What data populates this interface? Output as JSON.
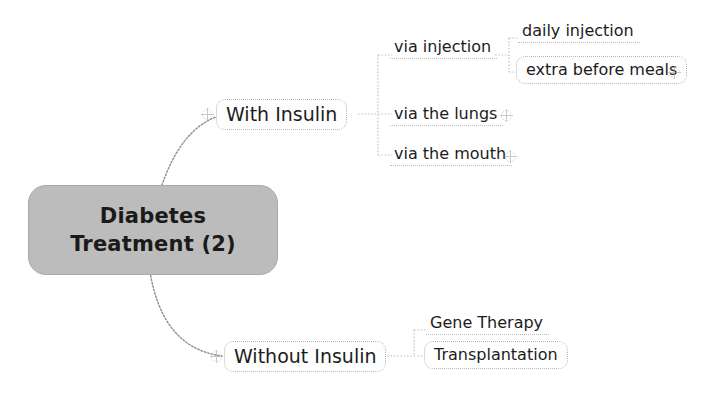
{
  "diagram": {
    "type": "mind-map",
    "background_color": "#ffffff",
    "root": {
      "label_line1": "Diabetes",
      "label_line2": "Treatment (2)",
      "fill_color": "#bcbcbc",
      "text_color": "#1a1a1a"
    },
    "branches": [
      {
        "id": "with-insulin",
        "label": "With Insulin",
        "children": [
          {
            "id": "via-injection",
            "label": "via injection",
            "children": [
              {
                "id": "daily-injection",
                "label": "daily injection"
              },
              {
                "id": "extra-before-meals",
                "label": "extra before meals"
              }
            ]
          },
          {
            "id": "via-the-lungs",
            "label": "via the lungs"
          },
          {
            "id": "via-the-mouth",
            "label": "via the mouth"
          }
        ]
      },
      {
        "id": "without-insulin",
        "label": "Without Insulin",
        "children": [
          {
            "id": "gene-therapy",
            "label": "Gene Therapy"
          },
          {
            "id": "transplantation",
            "label": "Transplantation"
          }
        ]
      }
    ],
    "expanders": [
      {
        "id": "expander-with-insulin"
      },
      {
        "id": "expander-extra-before-meals"
      },
      {
        "id": "expander-via-the-lungs"
      },
      {
        "id": "expander-via-the-mouth"
      },
      {
        "id": "expander-without-insulin"
      },
      {
        "id": "expander-transplantation"
      }
    ]
  }
}
